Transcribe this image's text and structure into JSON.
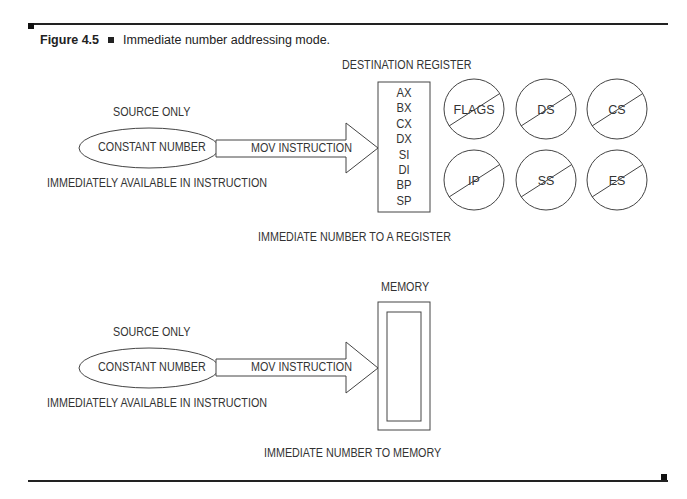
{
  "figure": {
    "number": "Figure 4.5",
    "title": "Immediate number addressing mode."
  },
  "panel_register": {
    "source_heading": "SOURCE ONLY",
    "source_ellipse_label": "CONSTANT NUMBER",
    "source_note": "IMMEDIATELY AVAILABLE IN INSTRUCTION",
    "arrow_label": "MOV INSTRUCTION",
    "destination_heading": "DESTINATION REGISTER",
    "allowed_registers": [
      "AX",
      "BX",
      "CX",
      "DX",
      "SI",
      "DI",
      "BP",
      "SP"
    ],
    "disallowed_registers": [
      "FLAGS",
      "DS",
      "CS",
      "IP",
      "SS",
      "ES"
    ],
    "subtitle": "IMMEDIATE NUMBER TO A REGISTER"
  },
  "panel_memory": {
    "source_heading": "SOURCE ONLY",
    "source_ellipse_label": "CONSTANT NUMBER",
    "source_note": "IMMEDIATELY AVAILABLE IN INSTRUCTION",
    "arrow_label": "MOV INSTRUCTION",
    "destination_heading": "MEMORY",
    "subtitle": "IMMEDIATE NUMBER TO MEMORY"
  },
  "colors": {
    "line": "#333333",
    "text": "#333333",
    "background": "#ffffff"
  }
}
